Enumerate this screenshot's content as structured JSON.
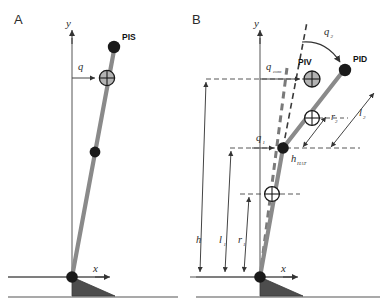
{
  "figure": {
    "background_color": "#ffffff",
    "colors": {
      "segment_gray": "#8a8a8a",
      "joint_dark": "#1a1a1a",
      "foot_fill": "#4d4d4d",
      "line_dark": "#333333",
      "com_fill": "#b3b3b3"
    }
  },
  "panels": [
    {
      "id": "A",
      "letter": "A",
      "axes": {
        "y_label": "y",
        "x_label": "x"
      },
      "point_labels": [
        {
          "name": "PIS",
          "text": "PIS"
        }
      ],
      "angle_labels": [
        {
          "name": "q",
          "base": "q",
          "sub": ""
        }
      ],
      "markers": {
        "com_count": 1,
        "joint_count": 1,
        "endpoint_count": 1,
        "origin_count": 1
      }
    },
    {
      "id": "B",
      "letter": "B",
      "axes": {
        "y_label": "y",
        "x_label": "x"
      },
      "point_labels": [
        {
          "name": "PIV",
          "text": "PIV"
        },
        {
          "name": "PID",
          "text": "PID"
        }
      ],
      "angle_labels": [
        {
          "name": "q_com",
          "base": "q",
          "sub": "com"
        },
        {
          "name": "q_1",
          "base": "q",
          "sub": "1"
        },
        {
          "name": "q_2",
          "base": "q",
          "sub": "2"
        }
      ],
      "length_labels": [
        {
          "name": "h",
          "base": "h",
          "sub": ""
        },
        {
          "name": "l_1",
          "base": "l",
          "sub": "1"
        },
        {
          "name": "r_1",
          "base": "r",
          "sub": "1"
        },
        {
          "name": "l_2",
          "base": "l",
          "sub": "2"
        },
        {
          "name": "r_2",
          "base": "r",
          "sub": "2"
        },
        {
          "name": "h_HAT",
          "base": "h",
          "sub": "HAT"
        }
      ],
      "markers": {
        "com_count": 2,
        "joint_count": 1,
        "endpoint_count": 1,
        "origin_count": 1
      }
    }
  ]
}
